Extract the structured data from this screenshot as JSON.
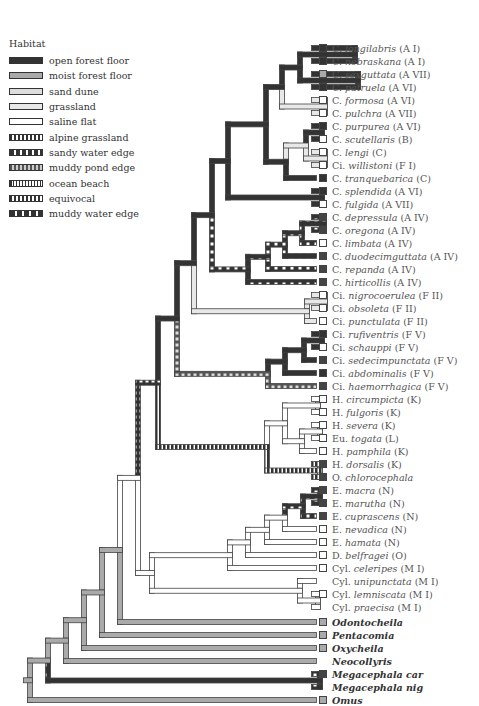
{
  "legend": {
    "title": "Habitat",
    "items": [
      {
        "key": "ofl",
        "label": "open forest floor",
        "fill": "#333333",
        "pattern": "solid"
      },
      {
        "key": "mfl",
        "label": "moist forest floor",
        "fill": "#aaaaaa",
        "pattern": "solid"
      },
      {
        "key": "sd",
        "label": "sand dune",
        "fill": "#dddddd",
        "pattern": "solid"
      },
      {
        "key": "gr",
        "label": "grassland",
        "fill": "#e8e8e8",
        "pattern": "solid"
      },
      {
        "key": "sf",
        "label": "saline flat",
        "fill": "#ffffff",
        "pattern": "solid"
      },
      {
        "key": "ag",
        "label": "alpine grassland",
        "fill": "#333333",
        "pattern": "dots-white"
      },
      {
        "key": "swe",
        "label": "sandy water edge",
        "fill": "#333333",
        "pattern": "dots-sparse"
      },
      {
        "key": "mpe",
        "label": "muddy pond edge",
        "fill": "#555555",
        "pattern": "dots-gray"
      },
      {
        "key": "ob",
        "label": "ocean beach",
        "fill": "#333333",
        "pattern": "stripes"
      },
      {
        "key": "eq",
        "label": "equivocal",
        "fill": "#444444",
        "pattern": "dots-white"
      },
      {
        "key": "mwe",
        "label": "muddy water edge",
        "fill": "#333333",
        "pattern": "dots-wide"
      }
    ]
  },
  "leaves": [
    {
      "prefix": "C.",
      "name": "longilabris",
      "suffix": "(A I)",
      "box": "#333333"
    },
    {
      "prefix": "C.",
      "name": "nebraskana",
      "suffix": "(A I)",
      "box": "#333333"
    },
    {
      "prefix": "C.",
      "name": "sexguttata",
      "suffix": "(A VII)",
      "box": "#aaaaaa"
    },
    {
      "prefix": "C.",
      "name": "patruela",
      "suffix": "(A VI)",
      "box": "#333333"
    },
    {
      "prefix": "C.",
      "name": "formosa",
      "suffix": "(A VI)",
      "box": "#ffffff"
    },
    {
      "prefix": "C.",
      "name": "pulchra",
      "suffix": "(A VII)",
      "box": "#ffffff"
    },
    {
      "prefix": "C.",
      "name": "purpurea",
      "suffix": "(A VI)",
      "box": "#333333"
    },
    {
      "prefix": "C.",
      "name": "scutellaris",
      "suffix": "(B)",
      "box": "#ffffff"
    },
    {
      "prefix": "C.",
      "name": "lengi",
      "suffix": "(C)",
      "box": "#ffffff"
    },
    {
      "prefix": "Ci.",
      "name": "willistoni",
      "suffix": "(F I)",
      "box": "#ffffff"
    },
    {
      "prefix": "C.",
      "name": "tranquebarica",
      "suffix": "(C)",
      "box": "#333333"
    },
    {
      "prefix": "C.",
      "name": "splendida",
      "suffix": "(A VI)",
      "box": "#333333"
    },
    {
      "prefix": "C.",
      "name": "fulgida",
      "suffix": "(A VII)",
      "box": "#ffffff"
    },
    {
      "prefix": "C.",
      "name": "depressula",
      "suffix": "(A IV)",
      "box": "#444444"
    },
    {
      "prefix": "C.",
      "name": "oregona",
      "suffix": "(A IV)",
      "box": "#444444"
    },
    {
      "prefix": "C.",
      "name": "limbata",
      "suffix": "(A IV)",
      "box": "#ffffff"
    },
    {
      "prefix": "C.",
      "name": "duodecimguttata",
      "suffix": "(A  IV)",
      "box": "#444444"
    },
    {
      "prefix": "C.",
      "name": "repanda",
      "suffix": "(A IV)",
      "box": "#444444"
    },
    {
      "prefix": "C.",
      "name": "hirticollis",
      "suffix": "(A IV)",
      "box": "#444444"
    },
    {
      "prefix": "Ci.",
      "name": "nigrocoerulea",
      "suffix": "(F II)",
      "box": "#ffffff"
    },
    {
      "prefix": "Ci.",
      "name": "obsoleta",
      "suffix": "(F II)",
      "box": "#ffffff"
    },
    {
      "prefix": "Ci.",
      "name": "punctulata",
      "suffix": "(F II)",
      "box": "#ffffff"
    },
    {
      "prefix": "Ci.",
      "name": "rufiventris",
      "suffix": "(F V)",
      "box": "#333333"
    },
    {
      "prefix": "Ci.",
      "name": "schauppi",
      "suffix": "(F V)",
      "box": "#ffffff"
    },
    {
      "prefix": "Ci.",
      "name": "sedecimpunctata",
      "suffix": "(F V)",
      "box": "#444444"
    },
    {
      "prefix": "Ci.",
      "name": "abdominalis",
      "suffix": "(F V)",
      "box": "#333333"
    },
    {
      "prefix": "Ci.",
      "name": "haemorrhagica",
      "suffix": "(F V)",
      "box": "#444444"
    },
    {
      "prefix": "H.",
      "name": "circumpicta",
      "suffix": "(K)",
      "box": "#ffffff"
    },
    {
      "prefix": "H.",
      "name": "fulgoris",
      "suffix": "(K)",
      "box": "#ffffff"
    },
    {
      "prefix": "H.",
      "name": "severa",
      "suffix": "(K)",
      "box": "#ffffff"
    },
    {
      "prefix": "Eu.",
      "name": "togata",
      "suffix": "(L)",
      "box": "#ffffff"
    },
    {
      "prefix": "H.",
      "name": "pamphila",
      "suffix": "(K)",
      "box": "#ffffff"
    },
    {
      "prefix": "H.",
      "name": "dorsalis",
      "suffix": "(K)",
      "box": "#444444"
    },
    {
      "prefix": "O.",
      "name": "chlorocephala",
      "suffix": "",
      "box": "#444444"
    },
    {
      "prefix": "E.",
      "name": "macra",
      "suffix": "(N)",
      "box": "#444444"
    },
    {
      "prefix": "E.",
      "name": "marutha",
      "suffix": "(N)",
      "box": "#444444"
    },
    {
      "prefix": "E.",
      "name": "cuprascens",
      "suffix": "(N)",
      "box": "#444444"
    },
    {
      "prefix": "E.",
      "name": "nevadica",
      "suffix": "(N)",
      "box": "#ffffff"
    },
    {
      "prefix": "E.",
      "name": "hamata",
      "suffix": "(N)",
      "box": "#ffffff"
    },
    {
      "prefix": "D.",
      "name": "belfragei",
      "suffix": "(O)",
      "box": "#ffffff"
    },
    {
      "prefix": "Cyl.",
      "name": "celeripes",
      "suffix": "(M I)",
      "box": "#ffffff"
    },
    {
      "prefix": "Cyl.",
      "name": "unipunctata",
      "suffix": "(M I)",
      "box": "none"
    },
    {
      "prefix": "Cyl.",
      "name": "lemniscata",
      "suffix": "(M I)",
      "box": "#ffffff"
    },
    {
      "prefix": "Cyl.",
      "name": "praecisa",
      "suffix": "(M I)",
      "box": "none"
    },
    {
      "prefix": "",
      "name": "Odontocheila",
      "suffix": "",
      "box": "#aaaaaa",
      "genus": true
    },
    {
      "prefix": "",
      "name": "Pentacomia",
      "suffix": "",
      "box": "#aaaaaa",
      "genus": true
    },
    {
      "prefix": "",
      "name": "Oxycheila",
      "suffix": "",
      "box": "#aaaaaa",
      "genus": true
    },
    {
      "prefix": "",
      "name": "Neocollyris",
      "suffix": "",
      "box": "none",
      "genus": true
    },
    {
      "prefix": "",
      "name": "Megacephala car",
      "suffix": "",
      "box": "#444444",
      "genus": true
    },
    {
      "prefix": "",
      "name": "Megacephala nig",
      "suffix": "",
      "box": "none",
      "genus": true
    },
    {
      "prefix": "",
      "name": "Omus",
      "suffix": "",
      "box": "#aaaaaa",
      "genus": true
    }
  ],
  "layout": {
    "leaf_top": 48,
    "leaf_step": 13.0,
    "tip_x": 314
  },
  "tree": {
    "comment_free": true,
    "nodes": [
      {
        "id": "n_li_ne",
        "x": 355,
        "children": [
          0,
          1
        ],
        "hab": "ofl"
      },
      {
        "id": "n_sx_pa",
        "x": 358,
        "children": [
          2,
          3
        ],
        "hab": "ofl"
      },
      {
        "id": "n_a",
        "x": 300,
        "children": [
          "n_li_ne",
          "n_sx_pa"
        ],
        "hab": "ofl"
      },
      {
        "id": "n_fo_pu",
        "x": 325,
        "children": [
          4,
          5
        ],
        "hab": "gr"
      },
      {
        "id": "n_b",
        "x": 282,
        "children": [
          "n_a",
          "n_fo_pu"
        ],
        "hab": "ofl"
      },
      {
        "id": "n_pp_sc",
        "x": 322,
        "children": [
          6,
          7
        ],
        "hab": "ofl"
      },
      {
        "id": "n_le_wi",
        "x": 325,
        "children": [
          8,
          9
        ],
        "hab": "gr"
      },
      {
        "id": "n_c",
        "x": 306,
        "children": [
          "n_pp_sc",
          "n_le_wi"
        ],
        "hab": "gr"
      },
      {
        "id": "n_d",
        "x": 286,
        "children": [
          "n_c",
          10
        ],
        "hab": "ofl"
      },
      {
        "id": "n_e",
        "x": 266,
        "children": [
          "n_b",
          "n_d"
        ],
        "hab": "ofl"
      },
      {
        "id": "n_sp_fu",
        "x": 322,
        "children": [
          11,
          12
        ],
        "hab": "ofl"
      },
      {
        "id": "n_f",
        "x": 228,
        "children": [
          "n_e",
          "n_sp_fu"
        ],
        "hab": "ofl"
      },
      {
        "id": "n_de_or",
        "x": 324,
        "children": [
          13,
          14
        ],
        "hab": "swe"
      },
      {
        "id": "n_g",
        "x": 302,
        "children": [
          "n_de_or",
          15
        ],
        "hab": "swe"
      },
      {
        "id": "n_h",
        "x": 285,
        "children": [
          "n_g",
          16
        ],
        "hab": "swe"
      },
      {
        "id": "n_i",
        "x": 268,
        "children": [
          "n_h",
          17
        ],
        "hab": "swe"
      },
      {
        "id": "n_j",
        "x": 248,
        "children": [
          "n_i",
          18
        ],
        "hab": "swe"
      },
      {
        "id": "n_k",
        "x": 212,
        "children": [
          "n_f",
          "n_j"
        ],
        "hab": "ofl"
      },
      {
        "id": "n_ni_ob",
        "x": 325,
        "children": [
          19,
          20
        ],
        "hab": "gr"
      },
      {
        "id": "n_l",
        "x": 307,
        "children": [
          "n_ni_ob",
          21
        ],
        "hab": "gr"
      },
      {
        "id": "n_m",
        "x": 194,
        "children": [
          "n_k",
          "n_l"
        ],
        "hab": "ofl"
      },
      {
        "id": "n_ru_sc",
        "x": 322,
        "children": [
          22,
          23
        ],
        "hab": "ofl"
      },
      {
        "id": "n_o",
        "x": 304,
        "children": [
          "n_ru_sc",
          24
        ],
        "hab": "ofl"
      },
      {
        "id": "n_p",
        "x": 285,
        "children": [
          "n_o",
          25
        ],
        "hab": "ofl"
      },
      {
        "id": "n_q",
        "x": 268,
        "children": [
          "n_p",
          26
        ],
        "hab": "mpe"
      },
      {
        "id": "n_r",
        "x": 177,
        "children": [
          "n_m",
          "n_q"
        ],
        "hab": "ofl"
      },
      {
        "id": "n_ci_fu",
        "x": 318,
        "children": [
          27,
          28
        ],
        "hab": "sf"
      },
      {
        "id": "n_se_to",
        "x": 320,
        "children": [
          29,
          30
        ],
        "hab": "sf"
      },
      {
        "id": "n_s",
        "x": 302,
        "children": [
          "n_se_to",
          31
        ],
        "hab": "sf"
      },
      {
        "id": "n_t",
        "x": 285,
        "children": [
          "n_ci_fu",
          "n_s"
        ],
        "hab": "sf"
      },
      {
        "id": "n_do_ch",
        "x": 320,
        "children": [
          32,
          33
        ],
        "hab": "ob"
      },
      {
        "id": "n_u",
        "x": 267,
        "children": [
          "n_t",
          "n_do_ch"
        ],
        "hab": "ob"
      },
      {
        "id": "n_v",
        "x": 158,
        "children": [
          "n_r",
          "n_u"
        ],
        "hab": "ag"
      },
      {
        "id": "n_ma_mu",
        "x": 320,
        "children": [
          34,
          35
        ],
        "hab": "swe"
      },
      {
        "id": "n_w",
        "x": 303,
        "children": [
          "n_ma_mu",
          36
        ],
        "hab": "swe"
      },
      {
        "id": "n_x",
        "x": 285,
        "children": [
          "n_w",
          37
        ],
        "hab": "sf"
      },
      {
        "id": "n_y",
        "x": 267,
        "children": [
          "n_x",
          38
        ],
        "hab": "sf"
      },
      {
        "id": "n_z",
        "x": 248,
        "children": [
          "n_y",
          39
        ],
        "hab": "sf"
      },
      {
        "id": "n_aa",
        "x": 230,
        "children": [
          "n_z",
          40
        ],
        "hab": "sf"
      },
      {
        "id": "n_le_pr",
        "x": 318,
        "children": [
          42,
          43
        ],
        "hab": "sf"
      },
      {
        "id": "n_bb",
        "x": 300,
        "children": [
          41,
          "n_le_pr"
        ],
        "hab": "sf"
      },
      {
        "id": "n_cc",
        "x": 152,
        "children": [
          "n_aa",
          "n_bb"
        ],
        "hab": "sf"
      },
      {
        "id": "n_dd",
        "x": 138,
        "children": [
          "n_v",
          "n_cc"
        ],
        "hab": "sf"
      },
      {
        "id": "n_ee",
        "x": 120,
        "children": [
          "n_dd",
          44
        ],
        "hab": "mfl"
      },
      {
        "id": "n_ff",
        "x": 102,
        "children": [
          "n_ee",
          45
        ],
        "hab": "mfl"
      },
      {
        "id": "n_gg",
        "x": 84,
        "children": [
          "n_ff",
          46
        ],
        "hab": "mfl"
      },
      {
        "id": "n_mega",
        "x": 320,
        "children": [
          48,
          49
        ],
        "hab": "mwe"
      },
      {
        "id": "n_hh",
        "x": 66,
        "children": [
          "n_gg",
          47
        ],
        "hab": "mfl"
      },
      {
        "id": "n_ii",
        "x": 48,
        "children": [
          "n_hh",
          "n_mega"
        ],
        "hab": "mfl"
      },
      {
        "id": "root",
        "x": 30,
        "children": [
          "n_ii",
          50
        ],
        "hab": "mfl"
      }
    ]
  }
}
